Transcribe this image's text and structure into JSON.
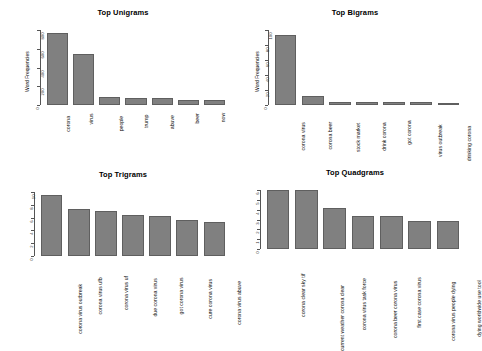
{
  "figure": {
    "background": "#ffffff",
    "bar_fill": "#808080",
    "bar_stroke": "#5f5f5f",
    "axis_color": "#555555"
  },
  "panels": [
    {
      "id": "unigrams",
      "title": "Top Unigrams",
      "ylabel": "Word Frequencies",
      "yticks": [
        "0",
        "200",
        "400",
        "600",
        "800"
      ],
      "chart_data": {
        "type": "bar",
        "title": "Top Unigrams",
        "xlabel": "",
        "ylabel": "Word Frequencies",
        "ylim": [
          0,
          900
        ],
        "grid": false,
        "legend": "none",
        "categories": [
          "corona",
          "virus",
          "people",
          "trump",
          "abuve",
          "beer",
          "now"
        ],
        "values": [
          860,
          610,
          95,
          90,
          85,
          65,
          58
        ]
      }
    },
    {
      "id": "bigrams",
      "title": "Top Bigrams",
      "ylabel": "Word Frequencies",
      "yticks": [
        "0",
        "20",
        "40",
        "60",
        "80",
        "100"
      ],
      "chart_data": {
        "type": "bar",
        "title": "Top Bigrams",
        "xlabel": "",
        "ylabel": "Word Frequencies",
        "ylim": [
          0,
          110
        ],
        "grid": false,
        "legend": "none",
        "categories": [
          "corona virus",
          "corona beer",
          "stock market",
          "drink corona",
          "got corona",
          "virus outbreak",
          "drinking corona"
        ],
        "values": [
          103,
          13,
          5,
          4,
          4,
          4,
          2
        ]
      }
    },
    {
      "id": "trigrams",
      "title": "Top Trigrams",
      "ylabel": "",
      "yticks": [
        "0",
        "2",
        "4",
        "6",
        "8",
        "10"
      ],
      "chart_data": {
        "type": "bar",
        "title": "Top Trigrams",
        "xlabel": "",
        "ylabel": "",
        "ylim": [
          0,
          10
        ],
        "grid": false,
        "legend": "none",
        "categories": [
          "corona virus outbreak",
          "corona virus ufb",
          "corona virus uf",
          "due corona virus",
          "got corona virus",
          "cure corona virus",
          "corona virus abuve"
        ],
        "values": [
          9.6,
          7.3,
          7.0,
          6.4,
          6.3,
          5.6,
          5.3
        ]
      }
    },
    {
      "id": "quadgrams",
      "title": "Top Quadgrams",
      "ylabel": "",
      "yticks": [
        "0",
        "1",
        "2",
        "3",
        "4",
        "5",
        "6"
      ],
      "chart_data": {
        "type": "bar",
        "title": "Top Quadgrams",
        "xlabel": "",
        "ylabel": "",
        "ylim": [
          0,
          6
        ],
        "grid": false,
        "legend": "none",
        "categories": [
          "corona clear sky tif",
          "current weather corona clear",
          "corona virus task force",
          "corona beer corona virus",
          "first case corona virus",
          "corona virus people dying",
          "dying worldwide use tool"
        ],
        "values": [
          6.0,
          6.0,
          4.2,
          3.4,
          3.4,
          2.8,
          2.8
        ]
      }
    }
  ]
}
